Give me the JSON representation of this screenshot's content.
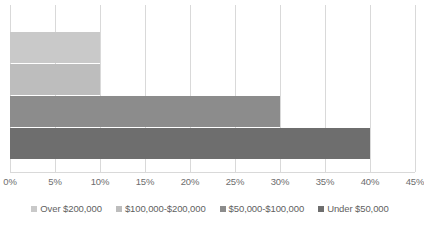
{
  "chart_data": {
    "type": "bar",
    "orientation": "horizontal",
    "title": "",
    "xlabel": "",
    "ylabel": "",
    "xlim": [
      0,
      45
    ],
    "xtick_labels": [
      "0%",
      "5%",
      "10%",
      "15%",
      "20%",
      "25%",
      "30%",
      "35%",
      "40%",
      "45%"
    ],
    "xticks": [
      0,
      5,
      10,
      15,
      20,
      25,
      30,
      35,
      40,
      45
    ],
    "grid": true,
    "legend_position": "bottom",
    "categories": [
      "Over $200,000",
      "$100,000-$200,000",
      "$50,000-$100,000",
      "Under $50,000"
    ],
    "values": [
      10,
      10,
      30,
      40
    ],
    "value_unit": "%",
    "series": [
      {
        "name": "Over $200,000",
        "value": 10,
        "color": "#c9c9c9"
      },
      {
        "name": "$100,000-$200,000",
        "value": 10,
        "color": "#bdbdbd"
      },
      {
        "name": "$50,000-$100,000",
        "value": 30,
        "color": "#8c8c8c"
      },
      {
        "name": "Under $50,000",
        "value": 40,
        "color": "#6e6e6e"
      }
    ]
  },
  "legend": {
    "items": [
      {
        "label": "Over $200,000",
        "color": "#c9c9c9"
      },
      {
        "label": "$100,000-$200,000",
        "color": "#bdbdbd"
      },
      {
        "label": "$50,000-$100,000",
        "color": "#8c8c8c"
      },
      {
        "label": "Under $50,000",
        "color": "#6e6e6e"
      }
    ]
  },
  "style": {
    "gridline_color": "#d9d9d9",
    "tick_label_color": "#6d6d6d",
    "legend_label_color": "#5f5f5f",
    "background": "#ffffff"
  }
}
